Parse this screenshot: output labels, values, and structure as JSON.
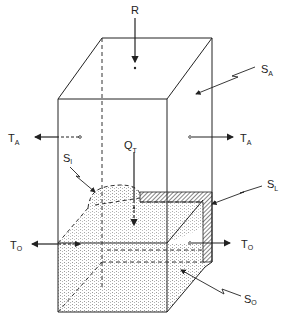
{
  "figure": {
    "colors": {
      "line": "#222222",
      "stipple": "#9a9a9a",
      "background": "#ffffff"
    }
  },
  "labels": {
    "R": {
      "main": "R",
      "sub": ""
    },
    "S_A": {
      "main": "S",
      "sub": "A"
    },
    "T_A_left": {
      "main": "T",
      "sub": "A"
    },
    "T_A_right": {
      "main": "T",
      "sub": "A"
    },
    "Q_T": {
      "main": "Q",
      "sub": "T"
    },
    "S_I": {
      "main": "S",
      "sub": "I"
    },
    "S_L": {
      "main": "S",
      "sub": "L"
    },
    "T_O_left": {
      "main": "T",
      "sub": "O"
    },
    "T_O_right": {
      "main": "T",
      "sub": "O"
    },
    "S_O": {
      "main": "S",
      "sub": "O"
    }
  }
}
